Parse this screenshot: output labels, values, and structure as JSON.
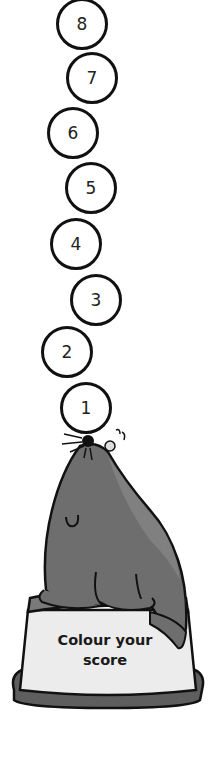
{
  "balls": [
    {
      "number": "8",
      "cx": 82,
      "cy": 24
    },
    {
      "number": "7",
      "cx": 92,
      "cy": 78
    },
    {
      "number": "6",
      "cx": 73,
      "cy": 133
    },
    {
      "number": "5",
      "cx": 91,
      "cy": 188
    },
    {
      "number": "4",
      "cx": 76,
      "cy": 244
    },
    {
      "number": "3",
      "cx": 96,
      "cy": 300
    },
    {
      "number": "2",
      "cx": 67,
      "cy": 352
    },
    {
      "number": "1",
      "cx": 86,
      "cy": 408
    }
  ],
  "pedestal": {
    "line1": "Colour your",
    "line2": "score"
  },
  "colors": {
    "seal": "#6e6e6e",
    "seal_light": "#888888",
    "pedestal_top": "#7a7a7a",
    "pedestal_face": "#ececec",
    "pedestal_base": "#5e5e5e",
    "outline": "#111111"
  }
}
